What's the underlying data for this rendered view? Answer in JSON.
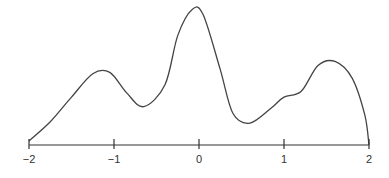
{
  "chart_data": {
    "type": "line",
    "title": "",
    "xlabel": "",
    "ylabel": "",
    "xlim": [
      -2,
      2
    ],
    "ylim": [
      0,
      1
    ],
    "grid": false,
    "legend": null,
    "x_ticks": [
      -2,
      -1,
      0,
      1,
      2
    ],
    "x_tick_labels": [
      "−2",
      "−1",
      "0",
      "1",
      "2"
    ],
    "series": [
      {
        "name": "density",
        "color": "#444444",
        "x": [
          -2.0,
          -1.75,
          -1.5,
          -1.25,
          -1.05,
          -0.85,
          -0.65,
          -0.4,
          -0.25,
          -0.08,
          0.05,
          0.25,
          0.4,
          0.6,
          0.85,
          1.0,
          1.2,
          1.4,
          1.6,
          1.8,
          1.95,
          2.0
        ],
        "y": [
          0.03,
          0.17,
          0.35,
          0.52,
          0.53,
          0.38,
          0.28,
          0.44,
          0.8,
          0.99,
          0.95,
          0.55,
          0.23,
          0.16,
          0.27,
          0.35,
          0.39,
          0.58,
          0.61,
          0.49,
          0.22,
          0.0
        ]
      }
    ]
  },
  "axis": {
    "color": "#333333"
  }
}
